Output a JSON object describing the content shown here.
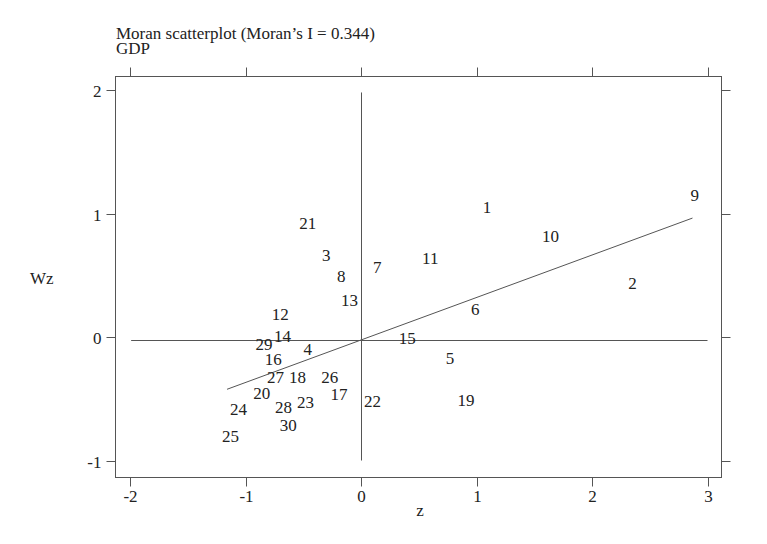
{
  "chart_data": {
    "type": "scatter",
    "title": "Moran scatterplot (Moran’s I = 0.344)",
    "subtitle": "GDP",
    "xlabel": "z",
    "ylabel": "Wz",
    "xlim": [
      -2.1,
      3.1
    ],
    "ylim": [
      -1.1,
      2.1
    ],
    "xticks": [
      -2,
      -1,
      0,
      1,
      2,
      3
    ],
    "yticks": [
      -1,
      0,
      1,
      2
    ],
    "grid": false,
    "legend": null,
    "reference_lines": {
      "x": 0,
      "y": 0
    },
    "regression_line": {
      "slope": 0.344,
      "x_start": -1.16,
      "x_end": 2.87
    },
    "points": [
      {
        "label": "1",
        "x": 1.09,
        "y": 1.05
      },
      {
        "label": "2",
        "x": 2.35,
        "y": 0.44
      },
      {
        "label": "3",
        "x": -0.3,
        "y": 0.66
      },
      {
        "label": "4",
        "x": -0.46,
        "y": -0.1
      },
      {
        "label": "5",
        "x": 0.77,
        "y": -0.17
      },
      {
        "label": "6",
        "x": 0.99,
        "y": 0.23
      },
      {
        "label": "7",
        "x": 0.14,
        "y": 0.57
      },
      {
        "label": "8",
        "x": -0.17,
        "y": 0.49
      },
      {
        "label": "9",
        "x": 2.89,
        "y": 1.15
      },
      {
        "label": "10",
        "x": 1.64,
        "y": 0.82
      },
      {
        "label": "11",
        "x": 0.6,
        "y": 0.64
      },
      {
        "label": "12",
        "x": -0.7,
        "y": 0.19
      },
      {
        "label": "13",
        "x": -0.1,
        "y": 0.3
      },
      {
        "label": "14",
        "x": -0.68,
        "y": 0.01
      },
      {
        "label": "15",
        "x": 0.4,
        "y": -0.01
      },
      {
        "label": "16",
        "x": -0.76,
        "y": -0.18
      },
      {
        "label": "17",
        "x": -0.19,
        "y": -0.46
      },
      {
        "label": "18",
        "x": -0.55,
        "y": -0.32
      },
      {
        "label": "19",
        "x": 0.91,
        "y": -0.51
      },
      {
        "label": "20",
        "x": -0.86,
        "y": -0.45
      },
      {
        "label": "21",
        "x": -0.46,
        "y": 0.92
      },
      {
        "label": "22",
        "x": 0.1,
        "y": -0.52
      },
      {
        "label": "23",
        "x": -0.48,
        "y": -0.53
      },
      {
        "label": "24",
        "x": -1.06,
        "y": -0.58
      },
      {
        "label": "25",
        "x": -1.13,
        "y": -0.8
      },
      {
        "label": "26",
        "x": -0.27,
        "y": -0.32
      },
      {
        "label": "27",
        "x": -0.74,
        "y": -0.32
      },
      {
        "label": "28",
        "x": -0.67,
        "y": -0.57
      },
      {
        "label": "29",
        "x": -0.84,
        "y": -0.06
      },
      {
        "label": "30",
        "x": -0.63,
        "y": -0.71
      }
    ]
  },
  "colors": {
    "ink": "#222222",
    "frame": "#555555",
    "background": "#ffffff"
  }
}
